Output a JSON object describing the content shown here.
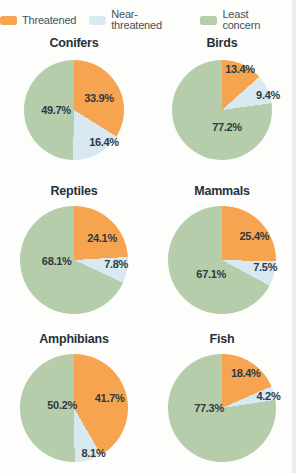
{
  "legend": [
    {
      "label": "Threatened",
      "color": "#f6a44f"
    },
    {
      "label": "Near-threatened",
      "color": "#d9e9f2"
    },
    {
      "label": "Least concern",
      "color": "#b5cdab"
    }
  ],
  "colors": {
    "threatened": "#f6a44f",
    "near_threatened": "#d9e9f2",
    "least_concern": "#b5cdab",
    "label_text": "#2c3a44",
    "title_text": "#25313c",
    "background": "#fdfdfb"
  },
  "chart_data": [
    {
      "type": "pie",
      "title": "Conifers",
      "labels": [
        "Threatened",
        "Near-threatened",
        "Least concern"
      ],
      "values": [
        33.9,
        16.4,
        49.7
      ],
      "start": "12 o'clock",
      "direction": "clockwise",
      "legend_position": "top"
    },
    {
      "type": "pie",
      "title": "Birds",
      "labels": [
        "Threatened",
        "Near-threatened",
        "Least concern"
      ],
      "values": [
        13.4,
        9.4,
        77.2
      ],
      "start": "12 o'clock",
      "direction": "clockwise",
      "legend_position": "top"
    },
    {
      "type": "pie",
      "title": "Reptiles",
      "labels": [
        "Threatened",
        "Near-threatened",
        "Least concern"
      ],
      "values": [
        24.1,
        7.8,
        68.1
      ],
      "start": "12 o'clock",
      "direction": "clockwise",
      "legend_position": "top"
    },
    {
      "type": "pie",
      "title": "Mammals",
      "labels": [
        "Threatened",
        "Near-threatened",
        "Least concern"
      ],
      "values": [
        25.4,
        7.5,
        67.1
      ],
      "start": "12 o'clock",
      "direction": "clockwise",
      "legend_position": "top"
    },
    {
      "type": "pie",
      "title": "Amphibians",
      "labels": [
        "Threatened",
        "Near-threatened",
        "Least concern"
      ],
      "values": [
        41.7,
        8.1,
        50.2
      ],
      "start": "12 o'clock",
      "direction": "clockwise",
      "legend_position": "top"
    },
    {
      "type": "pie",
      "title": "Fish",
      "labels": [
        "Threatened",
        "Near-threatened",
        "Least concern"
      ],
      "values": [
        18.4,
        4.2,
        77.3
      ],
      "start": "12 o'clock",
      "direction": "clockwise",
      "legend_position": "top"
    }
  ]
}
